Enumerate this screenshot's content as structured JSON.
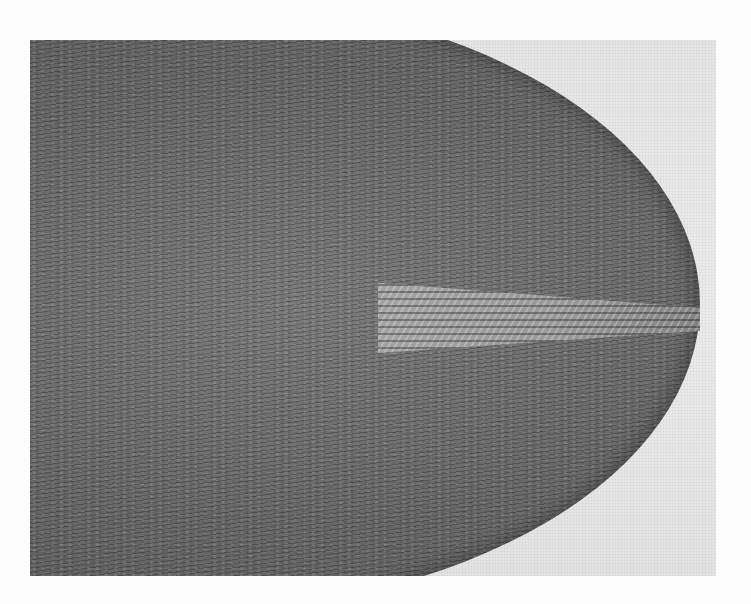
{
  "figure": {
    "colors": {
      "page_background": "#fdfdfd",
      "photo_background": "#e9e9e9",
      "fabric_dark": "#5e5e5e",
      "fabric_mid": "#7a7a7a",
      "patch_light": "#a6a6a6"
    }
  }
}
